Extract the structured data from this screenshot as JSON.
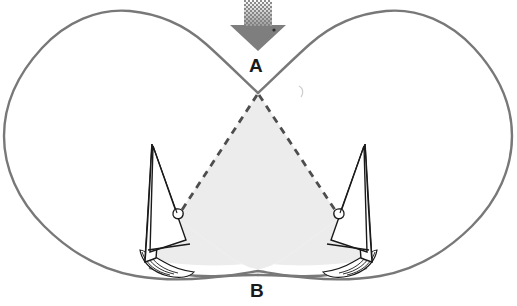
{
  "figure": {
    "type": "diagram",
    "canvas": {
      "width": 517,
      "height": 306,
      "background": "#ffffff"
    },
    "labels": [
      {
        "id": "A",
        "text": "A",
        "x": 258,
        "y": 66,
        "role": "upper-point-label"
      },
      {
        "id": "B",
        "text": "B",
        "x": 258,
        "y": 291,
        "role": "lower-point-label"
      }
    ],
    "colors": {
      "outline_stroke": "#787878",
      "shaded_region_fill": "#ececec",
      "dashed_line": "#4d4d4d",
      "arrow_fill": "#7e7e7e",
      "arrow_dither": "#9a9a9a",
      "boat_stroke": "#1a1a1a",
      "label_color": "#1a1a1a",
      "background": "#ffffff"
    },
    "arrow": {
      "name": "wind-direction-arrow",
      "direction": "down",
      "tip_x": 258,
      "tip_y": 50,
      "shaft_top_y": 2,
      "shaft_width": 28,
      "head_width": 58,
      "style": "solid gray with dithered halftone fade at top"
    },
    "outline": {
      "name": "butterfly-boundary",
      "stroke_width": 2.4,
      "closed": true,
      "notch_top_x": 258,
      "notch_top_y": 93,
      "notch_bottom_x": 258,
      "notch_bottom_y": 275
    },
    "shaded_triangle": {
      "name": "dashed-triangle-region",
      "apex": {
        "x": 258,
        "y": 93
      },
      "left_vertex": {
        "x": 180,
        "y": 214
      },
      "right_vertex": {
        "x": 337,
        "y": 214
      },
      "dash_pattern": "7 6",
      "dash_width": 2.6
    },
    "boats": [
      {
        "id": "left-boat",
        "name": "sailboat-left",
        "mast_top": {
          "x": 152,
          "y": 144
        },
        "hull_y": 262,
        "heading": "starboard-tack",
        "mirrored": false
      },
      {
        "id": "right-boat",
        "name": "sailboat-right",
        "mast_top": {
          "x": 365,
          "y": 144
        },
        "hull_y": 262,
        "heading": "port-tack",
        "mirrored": true
      }
    ]
  }
}
